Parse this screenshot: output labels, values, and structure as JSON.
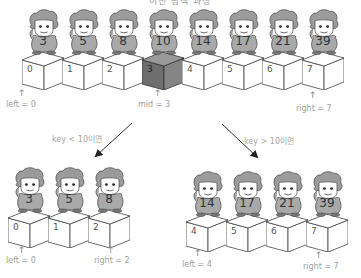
{
  "title": "이진 탐색 과정",
  "top_row": {
    "cells": [
      {
        "value": "3",
        "index": "0",
        "highlight": false
      },
      {
        "value": "5",
        "index": "1",
        "highlight": false
      },
      {
        "value": "8",
        "index": "2",
        "highlight": false
      },
      {
        "value": "10",
        "index": "3",
        "highlight": true
      },
      {
        "value": "14",
        "index": "4",
        "highlight": false
      },
      {
        "value": "17",
        "index": "5",
        "highlight": false
      },
      {
        "value": "21",
        "index": "6",
        "highlight": false
      },
      {
        "value": "39",
        "index": "7",
        "highlight": false
      }
    ],
    "left_label": "left = 0",
    "mid_label": "mid = 3",
    "right_label": "right = 7"
  },
  "branches": {
    "left_condition": "key < 10이면",
    "right_condition": "key > 10이면"
  },
  "bottom_left": {
    "cells": [
      {
        "value": "3",
        "index": "0"
      },
      {
        "value": "5",
        "index": "1"
      },
      {
        "value": "8",
        "index": "2"
      }
    ],
    "left_label": "left = 0",
    "right_label": "right = 2"
  },
  "bottom_right": {
    "cells": [
      {
        "value": "14",
        "index": "4"
      },
      {
        "value": "17",
        "index": "5"
      },
      {
        "value": "21",
        "index": "6"
      },
      {
        "value": "39",
        "index": "7"
      }
    ],
    "left_label": "left = 4",
    "right_label": "right = 7"
  },
  "colors": {
    "highlight_box": "#6e6e6e",
    "figure_body": "#a9a9a9",
    "label_text": "#a0a0a0"
  }
}
